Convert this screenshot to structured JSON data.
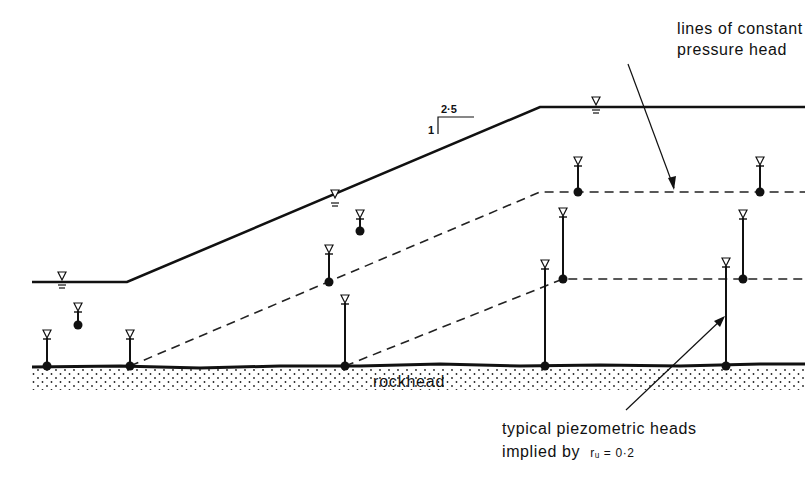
{
  "labels": {
    "pressure_line1": "lines of constant",
    "pressure_line2": "pressure head",
    "rockhead": "rockhead",
    "typical_line1": "typical piezometric heads",
    "typical_line2_prefix": "implied by",
    "ru_expression": "rᵤ = 0·2",
    "slope_horizontal": "2·5",
    "slope_vertical": "1"
  },
  "colors": {
    "ink": "#111111",
    "background": "#ffffff"
  },
  "geometry": {
    "ground_surface": [
      [
        32,
        282
      ],
      [
        127,
        282
      ],
      [
        540,
        107
      ],
      [
        805,
        107
      ]
    ],
    "rockhead_y": 366,
    "dashed_upper": [
      [
        130,
        366
      ],
      [
        540,
        192
      ],
      [
        805,
        192
      ]
    ],
    "dashed_lower": [
      [
        345,
        366
      ],
      [
        563,
        279
      ],
      [
        805,
        279
      ]
    ],
    "piezometers": [
      {
        "x": 47,
        "tip": 366,
        "head": 330
      },
      {
        "x": 78,
        "tip": 325,
        "head": 303
      },
      {
        "x": 130,
        "tip": 366,
        "head": 330
      },
      {
        "x": 329,
        "tip": 282,
        "head": 245
      },
      {
        "x": 360,
        "tip": 231,
        "head": 210
      },
      {
        "x": 345,
        "tip": 366,
        "head": 295
      },
      {
        "x": 545,
        "tip": 366,
        "head": 260
      },
      {
        "x": 563,
        "tip": 279,
        "head": 208
      },
      {
        "x": 578,
        "tip": 192,
        "head": 157
      },
      {
        "x": 726,
        "tip": 366,
        "head": 258
      },
      {
        "x": 743,
        "tip": 279,
        "head": 210
      },
      {
        "x": 760,
        "tip": 192,
        "head": 157
      }
    ],
    "water_table_markers": [
      [
        62,
        282
      ],
      [
        335,
        200
      ],
      [
        596,
        107
      ]
    ]
  }
}
